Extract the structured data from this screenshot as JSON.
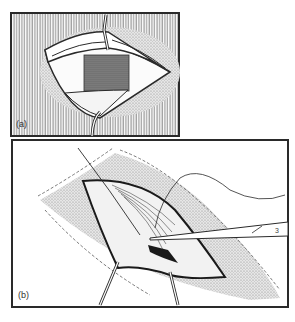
{
  "figure": {
    "panels": [
      {
        "id": "a",
        "label": "(a)",
        "description": "Opened incision with retracted skin flaps, stippled tissue block in centre, two retractor hooks above and below"
      },
      {
        "id": "b",
        "label": "(b)",
        "description": "Elliptical incision with retractors, fibrous tissue being dissected with scissors, suture thread"
      }
    ],
    "instrument_mark": "3"
  },
  "colors": {
    "ink": "#2a2a2a",
    "paper": "#ffffff",
    "stipple": "#c8c8c8",
    "dark_tissue": "#555555"
  }
}
